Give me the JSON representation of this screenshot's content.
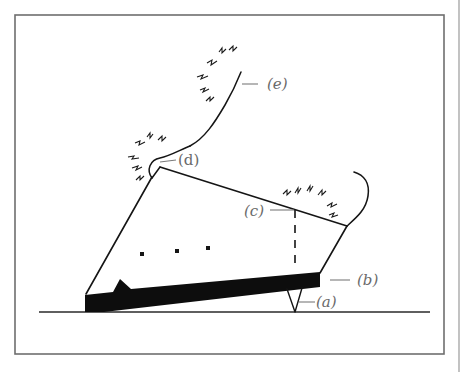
{
  "figure": {
    "labels": {
      "a": "(a)",
      "b": "(b)",
      "c": "(c)",
      "d": "(d)",
      "e": "(e)"
    },
    "colors": {
      "ink": "#151515",
      "label": "#6a6a6a",
      "frame": "#6e6e6e",
      "background": "#ffffff"
    }
  }
}
